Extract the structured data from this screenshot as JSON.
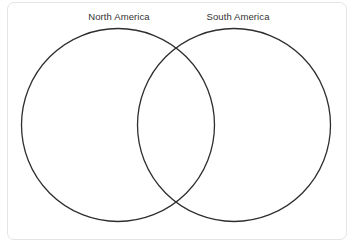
{
  "card": {
    "background_color": "#ffffff",
    "border_color": "#e4e4e4"
  },
  "diagram": {
    "type": "venn",
    "set_count": 2,
    "stroke_color": "#2e2e2e",
    "fill_color": "none",
    "label_color": "#333333",
    "sets": [
      {
        "label": "North America",
        "center_x": 118,
        "center_y": 125,
        "radius": 97,
        "label_x": 119,
        "label_y": 18
      },
      {
        "label": "South America",
        "center_x": 234,
        "center_y": 125,
        "radius": 97,
        "label_x": 238,
        "label_y": 18
      }
    ],
    "intersection": {
      "label": "",
      "items": [],
      "crossing_top": {
        "x": 176,
        "y": 55
      },
      "crossing_bottom": {
        "x": 176,
        "y": 196
      }
    },
    "left_only_items": [],
    "right_only_items": []
  }
}
